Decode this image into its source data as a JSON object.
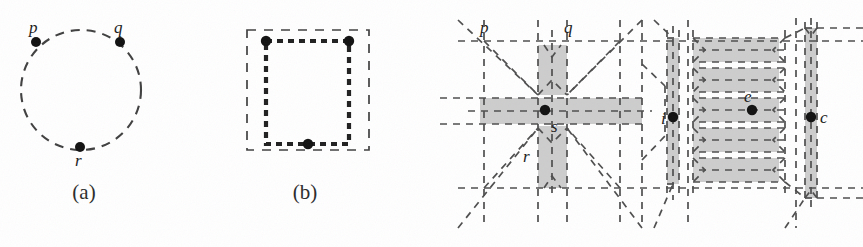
{
  "figure": {
    "kind": "scanned-paper-figure",
    "panels": [
      {
        "id": "a",
        "caption": "(a)",
        "shape": "dashed-circle",
        "vertices": [
          {
            "label": "p",
            "x": 36,
            "y": 42
          },
          {
            "label": "q",
            "x": 120,
            "y": 42
          },
          {
            "label": "r",
            "x": 80,
            "y": 147
          }
        ],
        "circle": {
          "cx": 81,
          "cy": 90,
          "r": 60
        }
      },
      {
        "id": "b",
        "caption": "(b)",
        "shape": "dashed-rectangle-with-offset-outline",
        "vertices": [
          {
            "label": "p",
            "x": 46,
            "y": 41
          },
          {
            "label": "q",
            "x": 129,
            "y": 41
          },
          {
            "label": "r",
            "x": 88,
            "y": 144
          }
        ],
        "inner_rect": {
          "x": 46,
          "y": 41,
          "w": 83,
          "h": 103
        },
        "outer_rect": {
          "x": 27,
          "y": 30,
          "w": 122,
          "h": 120
        }
      },
      {
        "id": "c",
        "caption": "",
        "shape": "straight-skeleton-offset-diagram",
        "vertices": [
          {
            "label": "s",
            "x": 545,
            "y": 110
          },
          {
            "label": "i",
            "x": 673,
            "y": 117
          },
          {
            "label": "e",
            "x": 752,
            "y": 100
          },
          {
            "label": "c",
            "x": 811,
            "y": 117
          }
        ]
      }
    ]
  },
  "colors": {
    "ink": "#2b2b2b",
    "dash": "#4a4a4a",
    "band_fill": "#c9c9c9",
    "band_fill_light": "#d6d6d6",
    "paper": "#ffffff",
    "dot": "#101010"
  },
  "labels": {
    "p": "p",
    "q": "q",
    "r": "r",
    "s": "s",
    "i": "i",
    "e": "e",
    "c": "c",
    "cap_a": "(a)",
    "cap_b": "(b)"
  }
}
